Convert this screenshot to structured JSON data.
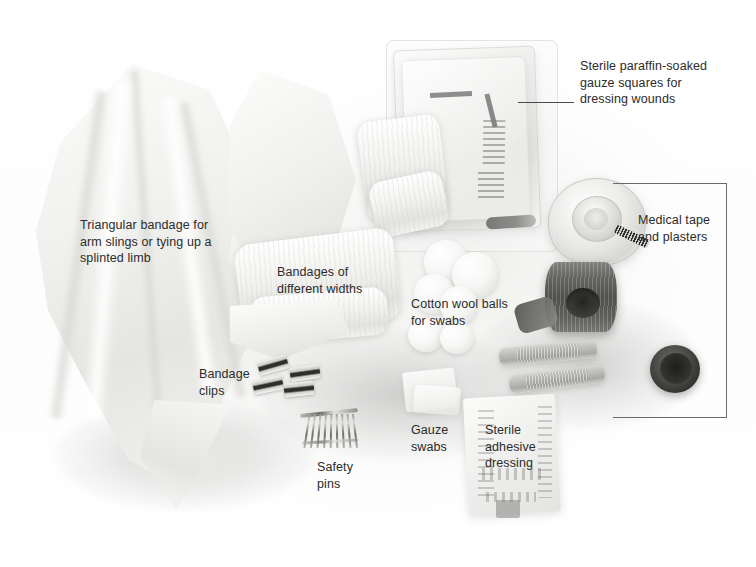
{
  "figure": {
    "background_color": "#ffffff",
    "text_color": "#2b2b2b",
    "line_color": "#4a4a4a"
  },
  "labels": [
    {
      "id": "paraffin-gauze",
      "name": "label-sterile-paraffin-gauze",
      "text": "Sterile paraffin-soaked\ngauze squares for\ndressing wounds",
      "x": 580,
      "y": 58,
      "align": "left",
      "leader": true
    },
    {
      "id": "triangular-bandage",
      "name": "label-triangular-bandage",
      "text": "Triangular bandage for\narm slings or tying up a\nsplinted limb",
      "x": 80,
      "y": 217,
      "align": "left",
      "leader": false
    },
    {
      "id": "medical-tape",
      "name": "label-medical-tape-and-plasters",
      "text": "Medical tape\nand plasters",
      "x": 638,
      "y": 212,
      "align": "left",
      "leader": false
    },
    {
      "id": "bandages-widths",
      "name": "label-bandages-of-different-widths",
      "text": "Bandages of\ndifferent widths",
      "x": 277,
      "y": 264,
      "align": "left",
      "leader": false
    },
    {
      "id": "cotton-wool",
      "name": "label-cotton-wool-balls",
      "text": "Cotton wool balls\nfor swabs",
      "x": 411,
      "y": 296,
      "align": "left",
      "leader": false
    },
    {
      "id": "bandage-clips",
      "name": "label-bandage-clips",
      "text": "Bandage\nclips",
      "x": 199,
      "y": 366,
      "align": "left",
      "leader": false
    },
    {
      "id": "gauze-swabs",
      "name": "label-gauze-swabs",
      "text": "Gauze\nswabs",
      "x": 411,
      "y": 422,
      "align": "left",
      "leader": false
    },
    {
      "id": "sterile-adhesive",
      "name": "label-sterile-adhesive-dressing",
      "text": "Sterile\nadhesive\ndressing",
      "x": 485,
      "y": 422,
      "align": "left",
      "leader": false
    },
    {
      "id": "safety-pins",
      "name": "label-safety-pins",
      "text": "Safety\npins",
      "x": 317,
      "y": 459,
      "align": "left",
      "leader": false
    }
  ],
  "leader_lines": [
    {
      "name": "leader-line-paraffin-gauze",
      "x": 518,
      "y": 102,
      "width": 56
    }
  ],
  "bracket": {
    "name": "callout-bracket-medical-tape",
    "top_y": 183,
    "bottom_y": 417,
    "left_x": 613,
    "right_x": 726
  },
  "objects": [
    {
      "name": "triangular-bandage-cloth"
    },
    {
      "name": "rolled-bandage-large"
    },
    {
      "name": "rolled-bandage-small"
    },
    {
      "name": "paraffin-gauze-tin"
    },
    {
      "name": "cotton-wool-balls"
    },
    {
      "name": "medical-tape-roll"
    },
    {
      "name": "tape-dispenser"
    },
    {
      "name": "plaster-strips"
    },
    {
      "name": "bandage-clips"
    },
    {
      "name": "safety-pins"
    },
    {
      "name": "gauze-swabs"
    },
    {
      "name": "sterile-adhesive-dressing-pack"
    },
    {
      "name": "dark-jar-lid"
    }
  ]
}
